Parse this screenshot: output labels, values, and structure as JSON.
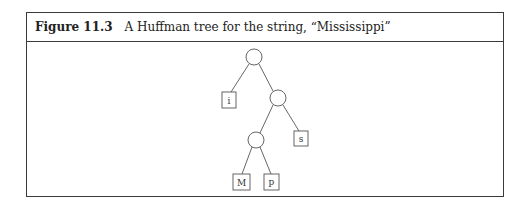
{
  "figure": {
    "label": "Figure 11.3",
    "caption": "A Huffman tree for the string, “Mississippi”"
  },
  "tree": {
    "internal_nodes": [
      {
        "id": "root",
        "cx": 254,
        "cy": 58
      },
      {
        "id": "n1",
        "cx": 278,
        "cy": 98
      },
      {
        "id": "n2",
        "cx": 256,
        "cy": 140
      }
    ],
    "leaves": [
      {
        "id": "leaf-i",
        "label": "i",
        "x": 222,
        "y": 92
      },
      {
        "id": "leaf-s",
        "label": "s",
        "x": 294,
        "y": 131
      },
      {
        "id": "leaf-M",
        "label": "M",
        "x": 233,
        "y": 174
      },
      {
        "id": "leaf-p",
        "label": "p",
        "x": 264,
        "y": 174
      }
    ],
    "edges": [
      [
        "root",
        "leaf-i"
      ],
      [
        "root",
        "n1"
      ],
      [
        "n1",
        "n2"
      ],
      [
        "n1",
        "leaf-s"
      ],
      [
        "n2",
        "leaf-M"
      ],
      [
        "n2",
        "leaf-p"
      ]
    ]
  }
}
